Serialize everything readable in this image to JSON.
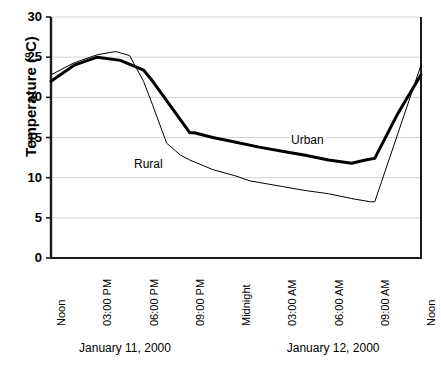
{
  "chart_data": {
    "type": "line",
    "title": "",
    "xlabel": "",
    "ylabel": "Temperature (°C)",
    "ylim": [
      0,
      30
    ],
    "ytick_values": [
      0,
      5,
      10,
      15,
      20,
      25,
      30
    ],
    "ytick_labels": [
      "0",
      "5",
      "10",
      "15",
      "20",
      "25",
      "30"
    ],
    "grid": true,
    "legend_position": "inline-annotation",
    "categories": [
      "Noon",
      "03:00 PM",
      "06:00 PM",
      "09:00 PM",
      "Midnight",
      "03:00 AM",
      "06:00 AM",
      "09:00 AM",
      "Noon"
    ],
    "group_labels": [
      "January 11, 2000",
      "January 12, 2000"
    ],
    "series": [
      {
        "name": "Urban",
        "color": "#000000",
        "linewidth": 3.0,
        "x": [
          0,
          0.5,
          1,
          1.5,
          2,
          2.2,
          2.5,
          3,
          3.1,
          3.5,
          4,
          4.5,
          5,
          5.5,
          6,
          6.5,
          6.8,
          7,
          7.5,
          8
        ],
        "values": [
          22.0,
          24.0,
          25.0,
          24.6,
          23.4,
          22.0,
          19.6,
          15.6,
          15.6,
          15.0,
          14.4,
          13.8,
          13.3,
          12.8,
          12.2,
          11.8,
          12.2,
          12.4,
          18.0,
          22.8
        ]
      },
      {
        "name": "Rural",
        "color": "#000000",
        "linewidth": 1.0,
        "x": [
          0,
          0.5,
          1,
          1.4,
          1.7,
          2,
          2.2,
          2.5,
          2.8,
          3,
          3.5,
          4,
          4.3,
          4.5,
          5,
          5.5,
          6,
          6.5,
          6.9,
          7,
          7.5,
          8
        ],
        "values": [
          22.8,
          24.3,
          25.3,
          25.7,
          25.2,
          22.0,
          19.0,
          14.3,
          12.8,
          12.2,
          11.0,
          10.2,
          9.6,
          9.4,
          8.9,
          8.4,
          8.0,
          7.4,
          7.0,
          7.0,
          15.5,
          24.0
        ]
      }
    ],
    "annotations": [
      {
        "text": "Urban",
        "x_px": 289,
        "y_px": 134
      },
      {
        "text": "Rural",
        "x_px": 132,
        "y_px": 158
      }
    ]
  },
  "axis": {
    "title_y": "Temperature (°C)"
  }
}
